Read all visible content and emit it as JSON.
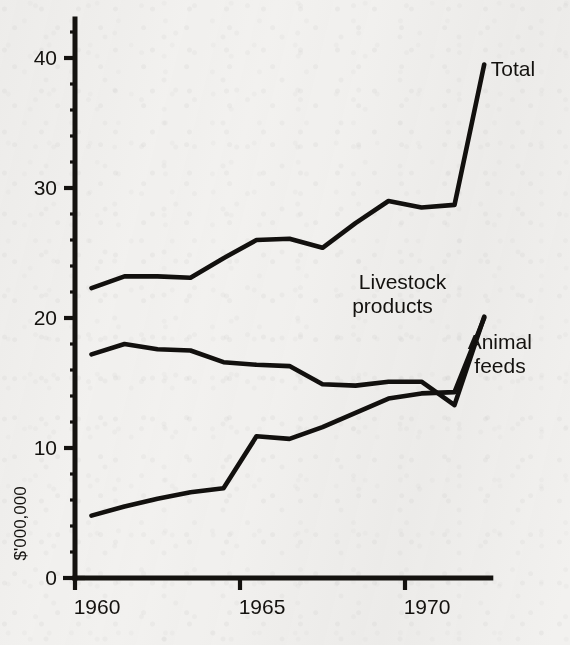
{
  "chart_data": {
    "type": "line",
    "title": "",
    "subtitle": "",
    "xlabel": "",
    "ylabel": "$'000,000",
    "xlim": [
      1960,
      1972.6
    ],
    "ylim": [
      0,
      43
    ],
    "grid": false,
    "legend_position": "inline-right-labels",
    "x_ticks": [
      "1960",
      "1965",
      "1970"
    ],
    "x_tick_values": [
      1960,
      1965,
      1970
    ],
    "y_ticks": [
      "0",
      "10",
      "20",
      "30",
      "40"
    ],
    "y_tick_values": [
      0,
      10,
      20,
      30,
      40
    ],
    "y_minor_step": 2,
    "line_color": "#12100e",
    "background_color": "#f2f1ef",
    "x": [
      1960.5,
      1961.5,
      1962.5,
      1963.5,
      1964.5,
      1965.5,
      1966.5,
      1967.5,
      1968.5,
      1969.5,
      1970.5,
      1971.5,
      1972.4
    ],
    "series": [
      {
        "name": "Total",
        "label": "Total",
        "values": [
          22.3,
          23.2,
          23.2,
          23.1,
          24.6,
          26.0,
          26.1,
          25.4,
          27.3,
          29.0,
          28.5,
          28.7,
          39.5
        ]
      },
      {
        "name": "Livestock products",
        "label": "Livestock products",
        "values": [
          17.2,
          18.0,
          17.6,
          17.5,
          16.6,
          16.4,
          16.3,
          14.9,
          14.8,
          15.1,
          15.1,
          13.3,
          20.1
        ]
      },
      {
        "name": "Animal feeds",
        "label": "Animal feeds",
        "values": [
          4.8,
          5.5,
          6.1,
          6.6,
          6.9,
          10.9,
          10.7,
          11.6,
          12.7,
          13.8,
          14.2,
          14.3,
          20.0
        ]
      }
    ],
    "annotations": [
      {
        "text": "Total",
        "for_series": "Total",
        "x": 1972.6,
        "y": 38.6
      },
      {
        "text": "Livestock",
        "for_series": "Livestock products",
        "x": 1968.6,
        "y": 22.2
      },
      {
        "text": "products",
        "for_series": "Livestock products",
        "x": 1968.4,
        "y": 20.4
      },
      {
        "text": "Animal",
        "for_series": "Animal feeds",
        "x": 1971.9,
        "y": 17.6
      },
      {
        "text": "feeds",
        "for_series": "Animal feeds",
        "x": 1972.1,
        "y": 15.8
      }
    ]
  }
}
